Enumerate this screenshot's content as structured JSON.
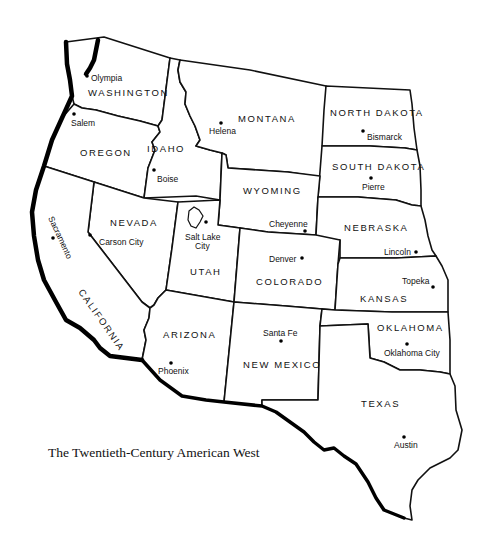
{
  "title": "The Twentieth-Century American West",
  "colors": {
    "ink": "#111111",
    "background": "#ffffff"
  },
  "states": [
    {
      "name": "WASHINGTON",
      "capital": "Olympia"
    },
    {
      "name": "OREGON",
      "capital": "Salem"
    },
    {
      "name": "IDAHO",
      "capital": "Boise"
    },
    {
      "name": "MONTANA",
      "capital": "Helena"
    },
    {
      "name": "NORTH DAKOTA",
      "capital": "Bismarck"
    },
    {
      "name": "SOUTH DAKOTA",
      "capital": "Pierre"
    },
    {
      "name": "WYOMING",
      "capital": "Cheyenne"
    },
    {
      "name": "NEBRASKA",
      "capital": "Lincoln"
    },
    {
      "name": "NEVADA",
      "capital": "Carson City"
    },
    {
      "name": "CALIFORNIA",
      "capital": "Sacramento"
    },
    {
      "name": "UTAH",
      "capital_line1": "Salt Lake",
      "capital_line2": "City"
    },
    {
      "name": "COLORADO",
      "capital": "Denver"
    },
    {
      "name": "KANSAS",
      "capital": "Topeka"
    },
    {
      "name": "ARIZONA",
      "capital": "Phoenix"
    },
    {
      "name": "NEW MEXICO",
      "capital": "Santa Fe"
    },
    {
      "name": "OKLAHOMA",
      "capital": "Oklahoma City"
    },
    {
      "name": "TEXAS",
      "capital": "Austin"
    }
  ]
}
